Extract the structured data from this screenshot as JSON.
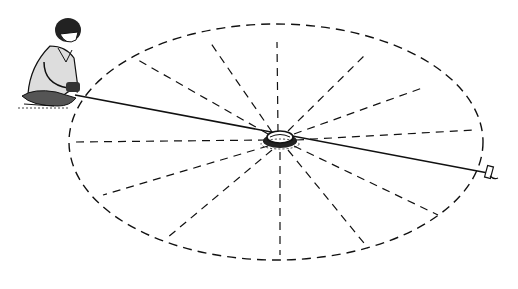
{
  "figure": {
    "cropped_caption_text": "",
    "colors": {
      "ink": "#111111",
      "background": "#ffffff"
    },
    "ellipse": {
      "cx": 276,
      "cy": 142,
      "rx": 207,
      "ry": 118
    },
    "center_stake": {
      "x": 280,
      "y": 138
    },
    "rope": {
      "from": [
        75,
        95
      ],
      "to": [
        488,
        173
      ]
    },
    "spokes": [
      [
        277,
        42
      ],
      [
        210,
        42
      ],
      [
        138,
        60
      ],
      [
        74,
        142
      ],
      [
        103,
        195
      ],
      [
        167,
        238
      ],
      [
        280,
        255
      ],
      [
        368,
        248
      ],
      [
        438,
        215
      ],
      [
        475,
        130
      ],
      [
        425,
        87
      ],
      [
        365,
        55
      ]
    ],
    "labels": {
      "person": "person-kneeling",
      "center": "center-peg",
      "end": "end-marker-stake"
    }
  }
}
